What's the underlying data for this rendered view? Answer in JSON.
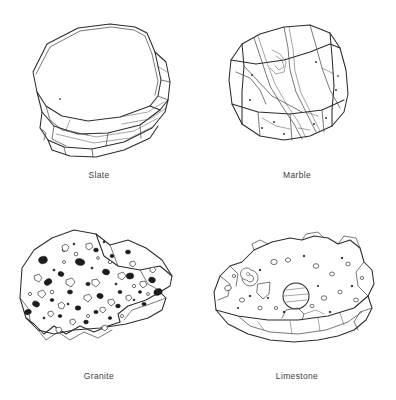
{
  "page": {
    "background_color": "#ffffff",
    "ink_color": "#2b2b2b",
    "caption_color": "#404040",
    "layout": "2x2 grid of labeled rock specimen line drawings"
  },
  "specimens": [
    {
      "id": "slate",
      "label": "Slate",
      "position": "top-left",
      "rock_type": "metamorphic",
      "texture": "foliated, flat layered slabs",
      "caption_color": "#404040"
    },
    {
      "id": "marble",
      "label": "Marble",
      "position": "top-right",
      "rock_type": "metamorphic",
      "texture": "blocky with flowing diagonal veins",
      "caption_color": "#404040"
    },
    {
      "id": "granite",
      "label": "Granite",
      "position": "bottom-left",
      "rock_type": "igneous",
      "texture": "coarse speckled crystals, dark and light grains",
      "caption_color": "#404040"
    },
    {
      "id": "limestone",
      "label": "Limestone",
      "position": "bottom-right",
      "rock_type": "sedimentary",
      "texture": "pitted surface with fossil inclusions and vugs",
      "caption_color": "#404040"
    }
  ]
}
